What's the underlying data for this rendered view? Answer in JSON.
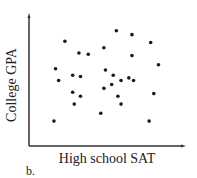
{
  "chart_data": {
    "type": "scatter",
    "title": "",
    "xlabel": "High school SAT",
    "ylabel": "College GPA",
    "panel_label": "b.",
    "grid": false,
    "ticks": "none",
    "legend": null,
    "xlim": [
      0,
      100
    ],
    "ylim": [
      0,
      100
    ],
    "points": [
      {
        "x": 56,
        "y": 88
      },
      {
        "x": 66,
        "y": 85
      },
      {
        "x": 23,
        "y": 80
      },
      {
        "x": 78,
        "y": 79
      },
      {
        "x": 32,
        "y": 71
      },
      {
        "x": 38,
        "y": 70
      },
      {
        "x": 48,
        "y": 75
      },
      {
        "x": 66,
        "y": 69
      },
      {
        "x": 83,
        "y": 62
      },
      {
        "x": 17,
        "y": 59
      },
      {
        "x": 49,
        "y": 58
      },
      {
        "x": 28,
        "y": 54
      },
      {
        "x": 33,
        "y": 53
      },
      {
        "x": 54,
        "y": 54
      },
      {
        "x": 19,
        "y": 50
      },
      {
        "x": 59,
        "y": 50
      },
      {
        "x": 64,
        "y": 52
      },
      {
        "x": 67,
        "y": 50
      },
      {
        "x": 53,
        "y": 47
      },
      {
        "x": 48,
        "y": 44
      },
      {
        "x": 28,
        "y": 41
      },
      {
        "x": 33,
        "y": 38
      },
      {
        "x": 57,
        "y": 38
      },
      {
        "x": 80,
        "y": 40
      },
      {
        "x": 29,
        "y": 32
      },
      {
        "x": 59,
        "y": 32
      },
      {
        "x": 46,
        "y": 25
      },
      {
        "x": 16,
        "y": 19
      },
      {
        "x": 77,
        "y": 19
      }
    ],
    "marker_color": "#1a1a1a",
    "axis_color": "#333333"
  }
}
